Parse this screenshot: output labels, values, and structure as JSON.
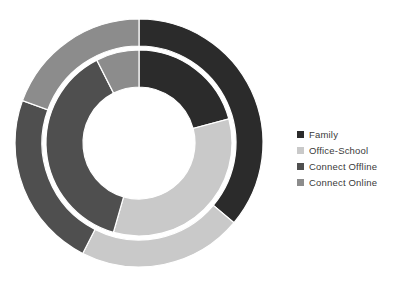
{
  "chart_data": {
    "type": "pie",
    "variant": "nested-donut",
    "title": "",
    "subtitle": "",
    "xlabel": "",
    "ylabel": "",
    "grid": false,
    "legend_position": "right",
    "categories": [
      "Family",
      "Office-School",
      "Connect Offline",
      "Connect Online"
    ],
    "colors": [
      "#2b2b2b",
      "#c9c9c9",
      "#4f4f4f",
      "#8c8c8c"
    ],
    "rings": [
      {
        "name": "Outer Ring",
        "inner_radius": 97,
        "outer_radius": 124,
        "start_angle": 0,
        "values": [
          36.1,
          21.4,
          23.1,
          19.4
        ],
        "angles": [
          130,
          77,
          83,
          70
        ],
        "segments": [
          {
            "label": "Family",
            "value": 36.1,
            "start_angle": 0,
            "end_angle": 130,
            "color": "#2b2b2b"
          },
          {
            "label": "Office-School",
            "value": 21.4,
            "start_angle": 130,
            "end_angle": 207,
            "color": "#c9c9c9"
          },
          {
            "label": "Connect Offline",
            "value": 23.1,
            "start_angle": 207,
            "end_angle": 290,
            "color": "#4f4f4f"
          },
          {
            "label": "Connect Online",
            "value": 19.4,
            "start_angle": 290,
            "end_angle": 360,
            "color": "#8c8c8c"
          }
        ]
      },
      {
        "name": "Inner Ring",
        "inner_radius": 56,
        "outer_radius": 93,
        "start_angle": 0,
        "values": [
          20.8,
          33.6,
          38.1,
          7.5
        ],
        "angles": [
          75,
          121,
          137,
          27
        ],
        "segments": [
          {
            "label": "Family",
            "value": 20.8,
            "start_angle": 0,
            "end_angle": 75,
            "color": "#2b2b2b"
          },
          {
            "label": "Office-School",
            "value": 33.6,
            "start_angle": 75,
            "end_angle": 196,
            "color": "#c9c9c9"
          },
          {
            "label": "Connect Offline",
            "value": 38.1,
            "start_angle": 196,
            "end_angle": 333,
            "color": "#4f4f4f"
          },
          {
            "label": "Connect Online",
            "value": 7.5,
            "start_angle": 333,
            "end_angle": 360,
            "color": "#8c8c8c"
          }
        ]
      }
    ],
    "center": {
      "x": 139,
      "y": 143
    },
    "separator_color": "#ffffff",
    "background": "#ffffff"
  },
  "legend": {
    "items": [
      {
        "label": "Family",
        "color": "#2b2b2b",
        "swatch_name": "legend-swatch-family"
      },
      {
        "label": "Office-School",
        "color": "#c9c9c9",
        "swatch_name": "legend-swatch-office-school"
      },
      {
        "label": "Connect Offline",
        "color": "#4f4f4f",
        "swatch_name": "legend-swatch-connect-offline"
      },
      {
        "label": "Connect Online",
        "color": "#8c8c8c",
        "swatch_name": "legend-swatch-connect-online"
      }
    ]
  }
}
